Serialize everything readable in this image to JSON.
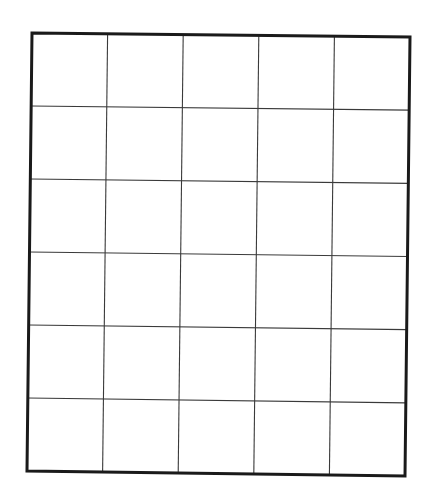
{
  "grid": {
    "columns": 5,
    "rows": 6,
    "corners": {
      "top_left": [
        32,
        33
      ],
      "top_right": [
        410,
        37
      ],
      "bottom_right": [
        405,
        476
      ],
      "bottom_left": [
        27,
        471
      ]
    },
    "colors": {
      "background": "#ffffff",
      "outer_border": "#1a1a1a",
      "inner_lines": "#3a3a3a"
    }
  }
}
